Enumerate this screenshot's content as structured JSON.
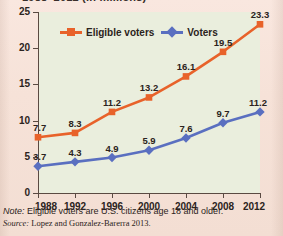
{
  "title_partial": "1988–2012 (in millions)",
  "legend": [
    {
      "label": "Eligible voters",
      "color": "#e8622a",
      "marker": "square"
    },
    {
      "label": "Voters",
      "color": "#5a6fc0",
      "marker": "diamond"
    }
  ],
  "notes": {
    "note_label": "Note:",
    "note_text": " Eligible voters are U.S. citizens age 18 and older.",
    "source_label": "Source:",
    "source_text": " Lopez and Gonzalez-Barerra 2013."
  },
  "chart_data": {
    "type": "line",
    "title": "1988–2012 (in millions)",
    "xlabel": "",
    "ylabel": "",
    "x": [
      1988,
      1992,
      1996,
      2000,
      2004,
      2008,
      2012
    ],
    "categories": [
      "1988",
      "1992",
      "1996",
      "2000",
      "2004",
      "2008",
      "2012"
    ],
    "ylim": [
      0,
      25
    ],
    "yticks": [
      0,
      5,
      10,
      15,
      20,
      25
    ],
    "grid": false,
    "legend_position": "top-center",
    "series": [
      {
        "name": "Eligible voters",
        "color": "#e8622a",
        "marker": "square",
        "values": [
          7.7,
          8.3,
          11.2,
          13.2,
          16.1,
          19.5,
          23.3
        ],
        "labels": [
          "7.7",
          "8.3",
          "11.2",
          "13.2",
          "16.1",
          "19.5",
          "23.3"
        ]
      },
      {
        "name": "Voters",
        "color": "#5a6fc0",
        "marker": "diamond",
        "values": [
          3.7,
          4.3,
          4.9,
          5.9,
          7.6,
          9.7,
          11.2
        ],
        "labels": [
          "3.7",
          "4.3",
          "4.9",
          "5.9",
          "7.6",
          "9.7",
          "11.2"
        ]
      }
    ]
  }
}
